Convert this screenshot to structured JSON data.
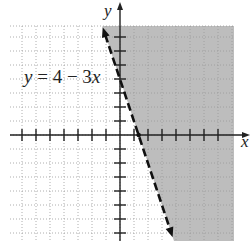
{
  "chart_data": {
    "type": "line",
    "title": "",
    "subtitle": "",
    "xlabel": "x",
    "ylabel": "y",
    "annotation": {
      "text_y": "y",
      "text_eq": " = 4 − 3",
      "text_x": "x"
    },
    "boundary": {
      "equation": "y = 4 - 3x",
      "slope": -3,
      "intercept": 4,
      "style": "dashed",
      "arrows": "both",
      "points": [
        [
          -1.24,
          7.7
        ],
        [
          3.76,
          -7.3
        ]
      ]
    },
    "shaded_region": "right of line (y > 4 - 3x)",
    "xlim": [
      -7.9,
      8.2
    ],
    "ylim": [
      -7.6,
      7.8
    ],
    "grid": true,
    "grid_spacing": 1,
    "x_ticks": [
      -7,
      -6,
      -5,
      -4,
      -3,
      -2,
      -1,
      1,
      2,
      3,
      4,
      5,
      6,
      7
    ],
    "y_ticks": [
      -7,
      -6,
      -5,
      -4,
      -3,
      -2,
      -1,
      1,
      2,
      3,
      4,
      5,
      6,
      7
    ],
    "colors": {
      "shade": "#bdbdbd",
      "grid": "#9a9a9a",
      "axis": "#222222",
      "line": "#111111"
    }
  }
}
